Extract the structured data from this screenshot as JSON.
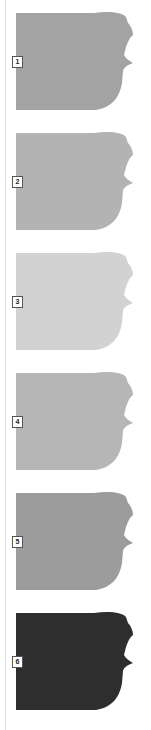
{
  "swatches": [
    {
      "number": "1",
      "color": "#a3a3a3"
    },
    {
      "number": "2",
      "color": "#b3b3b3"
    },
    {
      "number": "3",
      "color": "#d2d2d2"
    },
    {
      "number": "4",
      "color": "#b6b6b6"
    },
    {
      "number": "5",
      "color": "#9c9c9c"
    },
    {
      "number": "6",
      "color": "#2e2e2e"
    }
  ]
}
